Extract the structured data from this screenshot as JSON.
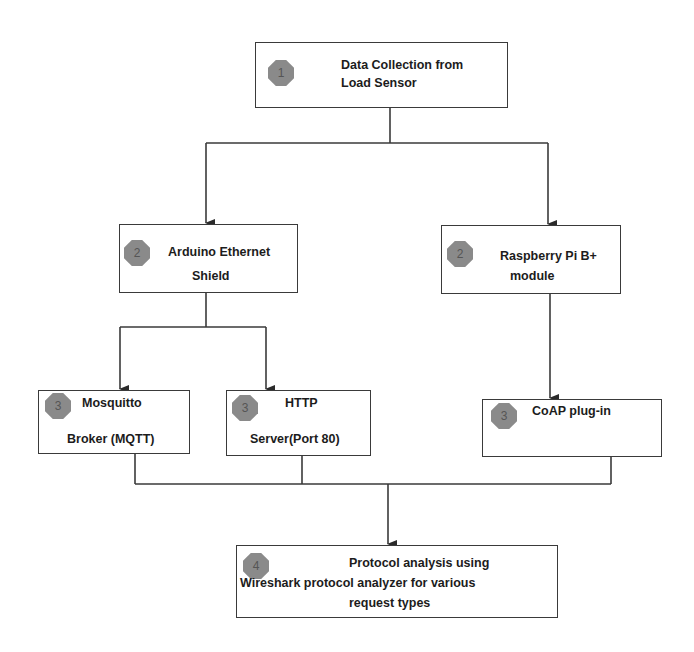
{
  "diagram": {
    "type": "flowchart",
    "nodes": [
      {
        "id": "n1",
        "step": "1",
        "line1": "Data Collection from",
        "line2": "Load Sensor"
      },
      {
        "id": "n2a",
        "step": "2",
        "line1": "Arduino Ethernet",
        "line2": "Shield"
      },
      {
        "id": "n2b",
        "step": "2",
        "line1": "Raspberry  Pi B+",
        "line2": "module"
      },
      {
        "id": "n3a",
        "step": "3",
        "line1": "Mosquitto",
        "line2": "Broker (MQTT)"
      },
      {
        "id": "n3b",
        "step": "3",
        "line1": "HTTP",
        "line2": "Server(Port 80)"
      },
      {
        "id": "n3c",
        "step": "3",
        "line1": "CoAP plug-in"
      },
      {
        "id": "n4",
        "step": "4",
        "line1": "Protocol analysis using",
        "line2": "Wireshark protocol analyzer for various",
        "line3": "request types"
      }
    ],
    "edges": [
      [
        "n1",
        "n2a"
      ],
      [
        "n1",
        "n2b"
      ],
      [
        "n2a",
        "n3a"
      ],
      [
        "n2a",
        "n3b"
      ],
      [
        "n2b",
        "n3c"
      ],
      [
        "n3a",
        "n4"
      ],
      [
        "n3b",
        "n4"
      ],
      [
        "n3c",
        "n4"
      ]
    ],
    "colors": {
      "line": "#3a3a3a",
      "badge": "#8a8a8a",
      "text": "#1c1c1c"
    }
  }
}
